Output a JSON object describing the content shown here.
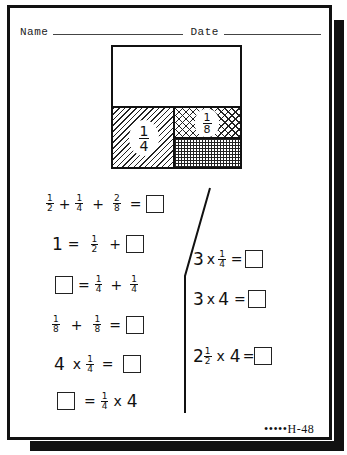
{
  "header": {
    "name_label": "Name",
    "date_label": "Date"
  },
  "diagram": {
    "quarter_label": {
      "numerator": "1",
      "denominator": "4"
    },
    "eighth_label": {
      "numerator": "1",
      "denominator": "8"
    }
  },
  "left_problems": [
    {
      "terms": [
        "1/2",
        "+",
        "1/4",
        "+",
        "2/8",
        "=",
        "□"
      ]
    },
    {
      "terms": [
        "1",
        "=",
        "1/2",
        "+",
        "□"
      ]
    },
    {
      "terms": [
        "□",
        "=",
        "1/4",
        "+",
        "1/4"
      ]
    },
    {
      "terms": [
        "1/8",
        "+",
        "1/8",
        "=",
        "□"
      ]
    },
    {
      "terms": [
        "4",
        "x",
        "1/4",
        "=",
        "□"
      ]
    },
    {
      "terms": [
        "□",
        "=",
        "1/4",
        "x",
        "4"
      ]
    }
  ],
  "right_problems": [
    {
      "terms": [
        "3",
        "x",
        "1/4",
        "=",
        "□"
      ]
    },
    {
      "terms": [
        "3",
        "x",
        "4",
        "=",
        "□"
      ]
    },
    {
      "terms": [
        "2 1/2",
        "x",
        "4",
        "=",
        "□"
      ]
    }
  ],
  "text": {
    "one": "1",
    "plus": "+",
    "equals": "=",
    "times": "x",
    "n1": "1",
    "n2": "2",
    "n3": "3",
    "n4": "4",
    "n8": "8"
  },
  "footer": {
    "page_code": "•••••H-48"
  }
}
